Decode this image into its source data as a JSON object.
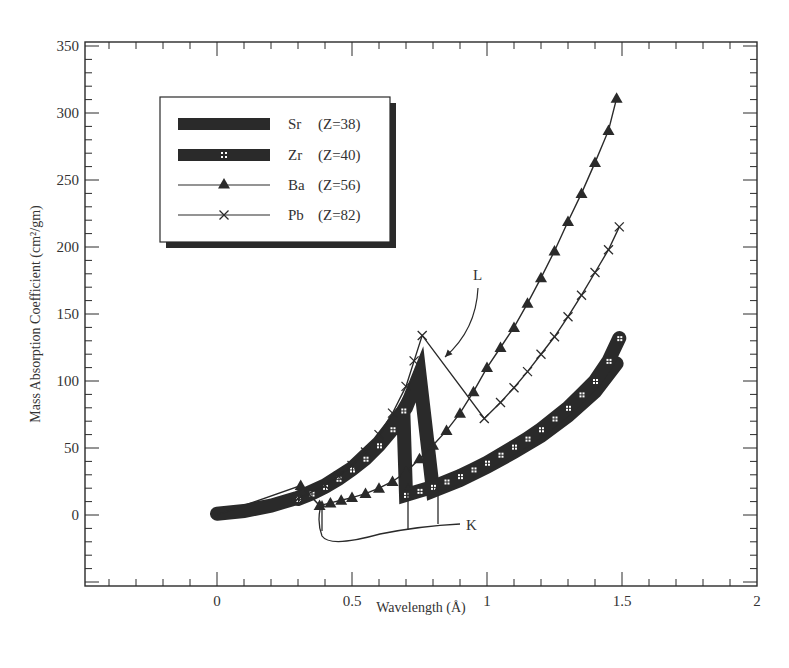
{
  "chart_data": {
    "type": "line",
    "title": "",
    "xlabel": "Wavelength (Å)",
    "ylabel": "Mass Absorption Coefficient (cm²/gm)",
    "xlim": [
      -0.5,
      2
    ],
    "ylim": [
      -52,
      350
    ],
    "x_ticks": [
      "0",
      "0.5",
      "1",
      "1.5",
      "2"
    ],
    "x_tick_values": [
      0,
      0.5,
      1,
      1.5,
      2
    ],
    "y_ticks": [
      "0",
      "50",
      "100",
      "150",
      "200",
      "250",
      "300",
      "350"
    ],
    "y_tick_values": [
      0,
      50,
      100,
      150,
      200,
      250,
      300,
      350
    ],
    "grid": false,
    "legend_position": "upper-left (boxed with shadow)",
    "series": [
      {
        "name": "Sr",
        "label": "Sr",
        "z_label": "(Z=38)",
        "style": "thick-solid",
        "points": [
          [
            0,
            1
          ],
          [
            0.1,
            3
          ],
          [
            0.2,
            7
          ],
          [
            0.3,
            13
          ],
          [
            0.4,
            22
          ],
          [
            0.5,
            35
          ],
          [
            0.6,
            54
          ],
          [
            0.7,
            80
          ],
          [
            0.75,
            105
          ],
          [
            0.8,
            18
          ],
          [
            0.9,
            26
          ],
          [
            1.0,
            36
          ],
          [
            1.1,
            47
          ],
          [
            1.2,
            59
          ],
          [
            1.3,
            74
          ],
          [
            1.4,
            92
          ],
          [
            1.48,
            113
          ]
        ]
      },
      {
        "name": "Zr",
        "label": "Zr",
        "z_label": "(Z=40)",
        "style": "thick-dotted-markers",
        "points": [
          [
            0.3,
            12
          ],
          [
            0.35,
            16
          ],
          [
            0.4,
            21
          ],
          [
            0.45,
            27
          ],
          [
            0.5,
            34
          ],
          [
            0.55,
            42
          ],
          [
            0.6,
            52
          ],
          [
            0.65,
            64
          ],
          [
            0.69,
            78
          ],
          [
            0.7,
            15
          ],
          [
            0.75,
            18
          ],
          [
            0.8,
            21
          ],
          [
            0.85,
            25
          ],
          [
            0.9,
            29
          ],
          [
            0.95,
            34
          ],
          [
            1.0,
            39
          ],
          [
            1.05,
            45
          ],
          [
            1.1,
            51
          ],
          [
            1.15,
            57
          ],
          [
            1.2,
            64
          ],
          [
            1.25,
            72
          ],
          [
            1.3,
            80
          ],
          [
            1.35,
            90
          ],
          [
            1.4,
            100
          ],
          [
            1.45,
            115
          ],
          [
            1.49,
            132
          ]
        ]
      },
      {
        "name": "Ba",
        "label": "Ba",
        "z_label": "(Z=56)",
        "style": "thin-triangle-markers",
        "points": [
          [
            0,
            0
          ],
          [
            0.31,
            22
          ],
          [
            0.38,
            7
          ],
          [
            0.42,
            9
          ],
          [
            0.46,
            11
          ],
          [
            0.5,
            13
          ],
          [
            0.55,
            16
          ],
          [
            0.6,
            20
          ],
          [
            0.65,
            25
          ],
          [
            0.7,
            32
          ],
          [
            0.75,
            42
          ],
          [
            0.8,
            52
          ],
          [
            0.85,
            63
          ],
          [
            0.9,
            76
          ],
          [
            0.95,
            92
          ],
          [
            1.0,
            110
          ],
          [
            1.05,
            125
          ],
          [
            1.1,
            140
          ],
          [
            1.15,
            158
          ],
          [
            1.2,
            177
          ],
          [
            1.25,
            197
          ],
          [
            1.3,
            219
          ],
          [
            1.35,
            240
          ],
          [
            1.4,
            263
          ],
          [
            1.45,
            287
          ],
          [
            1.48,
            311
          ]
        ]
      },
      {
        "name": "Pb",
        "label": "Pb",
        "z_label": "(Z=82)",
        "style": "thin-x-markers",
        "points": [
          [
            0.3,
            12
          ],
          [
            0.4,
            22
          ],
          [
            0.45,
            29
          ],
          [
            0.5,
            37
          ],
          [
            0.55,
            47
          ],
          [
            0.6,
            60
          ],
          [
            0.65,
            76
          ],
          [
            0.7,
            96
          ],
          [
            0.73,
            115
          ],
          [
            0.76,
            134
          ],
          [
            0.99,
            72
          ],
          [
            1.05,
            84
          ],
          [
            1.1,
            95
          ],
          [
            1.15,
            107
          ],
          [
            1.2,
            120
          ],
          [
            1.25,
            133
          ],
          [
            1.3,
            148
          ],
          [
            1.35,
            164
          ],
          [
            1.4,
            181
          ],
          [
            1.45,
            198
          ],
          [
            1.49,
            215
          ]
        ]
      }
    ],
    "annotations": [
      {
        "text": "L",
        "target": "Pb L-edge",
        "position": [
          0.97,
          180
        ]
      },
      {
        "text": "K",
        "target": "K-edges (Ba, Zr, Sr)",
        "position": [
          0.95,
          -10
        ]
      }
    ]
  },
  "labels": {
    "xlabel": "Wavelength (Å)",
    "ylabel": "Mass Absorption Coefficient (cm²/gm)",
    "annotation_L": "L",
    "annotation_K": "K"
  },
  "colors": {
    "ink": "#2a2a2a",
    "background": "#ffffff"
  }
}
